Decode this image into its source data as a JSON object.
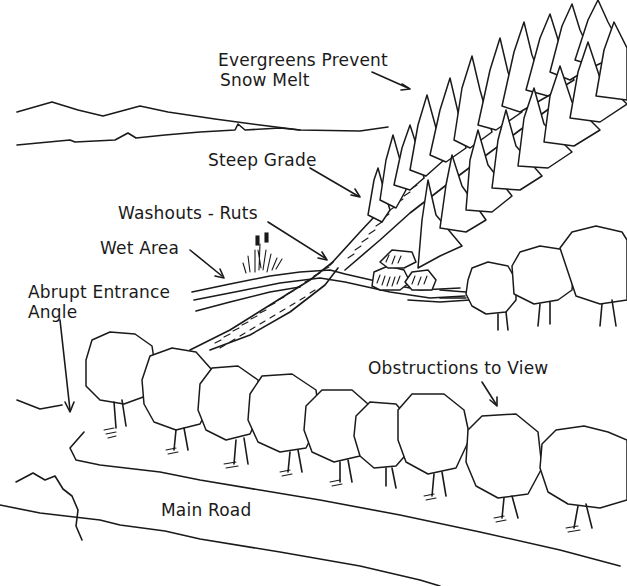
{
  "diagram": {
    "type": "illustrated-site-sketch",
    "ink_color": "#1a1a1a",
    "background": "#ffffff",
    "labels": [
      {
        "id": "evergreens",
        "text_line1": "Evergreens Prevent",
        "text_line2": "Snow Melt"
      },
      {
        "id": "steep-grade",
        "text": "Steep Grade"
      },
      {
        "id": "washouts",
        "text": "Washouts - Ruts"
      },
      {
        "id": "wet-area",
        "text": "Wet Area"
      },
      {
        "id": "abrupt-entrance",
        "text_line1": "Abrupt Entrance",
        "text_line2": "Angle"
      },
      {
        "id": "obstructions",
        "text": "Obstructions to View"
      },
      {
        "id": "main-road",
        "text": "Main Road"
      }
    ],
    "elements": [
      "distant-hills",
      "evergreen-tree-row",
      "steep-driveway",
      "wet-area-stream",
      "cattails-grass",
      "rocks",
      "deciduous-tree-row",
      "main-road-edge"
    ]
  }
}
